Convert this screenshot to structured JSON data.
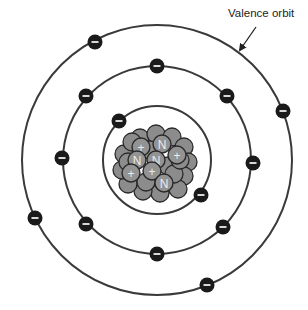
{
  "label": {
    "text": "Valence orbit",
    "x": 228,
    "y": 17
  },
  "arrow": {
    "from": [
      256,
      27
    ],
    "to": [
      240,
      50
    ]
  },
  "atom": {
    "center": [
      157,
      160
    ],
    "orbits": [
      {
        "name": "inner",
        "radius": 54,
        "electrons": [
          [
            119,
            121
          ],
          [
            201,
            195
          ]
        ]
      },
      {
        "name": "middle",
        "radius": 94,
        "electrons": [
          [
            157,
            66
          ],
          [
            86,
            96
          ],
          [
            227,
            96
          ],
          [
            62,
            158
          ],
          [
            253,
            163
          ],
          [
            86,
            224
          ],
          [
            223,
            227
          ],
          [
            157,
            254
          ]
        ]
      },
      {
        "name": "outer-valence",
        "radius": 135,
        "electrons": [
          [
            95,
            42
          ],
          [
            283,
            111
          ],
          [
            35,
            218
          ],
          [
            207,
            285
          ]
        ]
      }
    ],
    "electron_symbol": "−",
    "nucleus": {
      "background_particles": [
        [
          140,
          138
        ],
        [
          156,
          134
        ],
        [
          172,
          137
        ],
        [
          184,
          147
        ],
        [
          188,
          162
        ],
        [
          184,
          176
        ],
        [
          178,
          189
        ],
        [
          160,
          193
        ],
        [
          143,
          191
        ],
        [
          128,
          184
        ],
        [
          122,
          170
        ],
        [
          124,
          154
        ],
        [
          132,
          142
        ],
        [
          150,
          150
        ],
        [
          168,
          166
        ],
        [
          146,
          182
        ],
        [
          174,
          174
        ],
        [
          180,
          160
        ],
        [
          128,
          162
        ]
      ],
      "labeled_particles": [
        {
          "symbol": "+",
          "pos": [
            141,
            147
          ],
          "kind": "proton"
        },
        {
          "symbol": "N",
          "pos": [
            162,
            144
          ],
          "kind": "neutron"
        },
        {
          "symbol": "+",
          "pos": [
            177,
            155
          ],
          "kind": "proton"
        },
        {
          "symbol": "N",
          "pos": [
            137,
            160
          ],
          "kind": "neutron"
        },
        {
          "symbol": "N",
          "pos": [
            156,
            160
          ],
          "kind": "neutron"
        },
        {
          "symbol": "+",
          "pos": [
            131,
            173
          ],
          "kind": "proton"
        },
        {
          "symbol": "+",
          "pos": [
            152,
            171
          ],
          "kind": "proton"
        },
        {
          "symbol": "N",
          "pos": [
            164,
            183
          ],
          "kind": "neutron"
        }
      ]
    }
  },
  "colors": {
    "orbit": "#3a3a3a",
    "electron": "#1a1a1a",
    "nucleon": "#8c8c8c",
    "nucleon_outline": "#2a2a2a",
    "glyph": "#ececec"
  }
}
